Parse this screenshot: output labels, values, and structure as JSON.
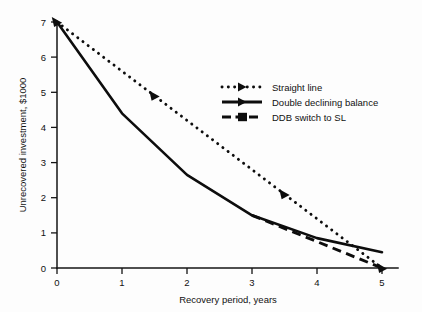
{
  "chart_data": {
    "type": "line",
    "title": "",
    "xlabel": "Recovery period, years",
    "ylabel": "Unrecovered investment, $1000",
    "xlim": [
      0,
      5.25
    ],
    "ylim": [
      0,
      7.35
    ],
    "xticks": [
      "0",
      "1",
      "2",
      "3",
      "4",
      "5"
    ],
    "xtick_values": [
      0,
      1,
      2,
      3,
      4,
      5
    ],
    "yticks": [
      "0",
      "1",
      "2",
      "3",
      "4",
      "5",
      "6",
      "7"
    ],
    "ytick_values": [
      0,
      1,
      2,
      3,
      4,
      5,
      6,
      7
    ],
    "grid": false,
    "legend_position": "upper right",
    "series": [
      {
        "name": "Straight line",
        "style": "dotted",
        "marker": "triangle-right",
        "x": [
          0,
          1,
          2,
          3,
          4,
          5
        ],
        "values": [
          7.0,
          5.6,
          4.2,
          2.8,
          1.4,
          0.0
        ]
      },
      {
        "name": "Double declining balance",
        "style": "solid",
        "marker": "none",
        "x": [
          0,
          1,
          2,
          3,
          4,
          5
        ],
        "values": [
          7.0,
          4.4,
          2.65,
          1.5,
          0.85,
          0.45
        ]
      },
      {
        "name": "DDB switch to SL",
        "style": "dashed",
        "marker": "none",
        "x": [
          3,
          4,
          5
        ],
        "values": [
          1.5,
          0.75,
          0.0
        ]
      }
    ]
  },
  "legend": {
    "items": [
      {
        "label": "Straight line"
      },
      {
        "label": "Double declining balance"
      },
      {
        "label": "DDB switch to SL"
      }
    ]
  }
}
